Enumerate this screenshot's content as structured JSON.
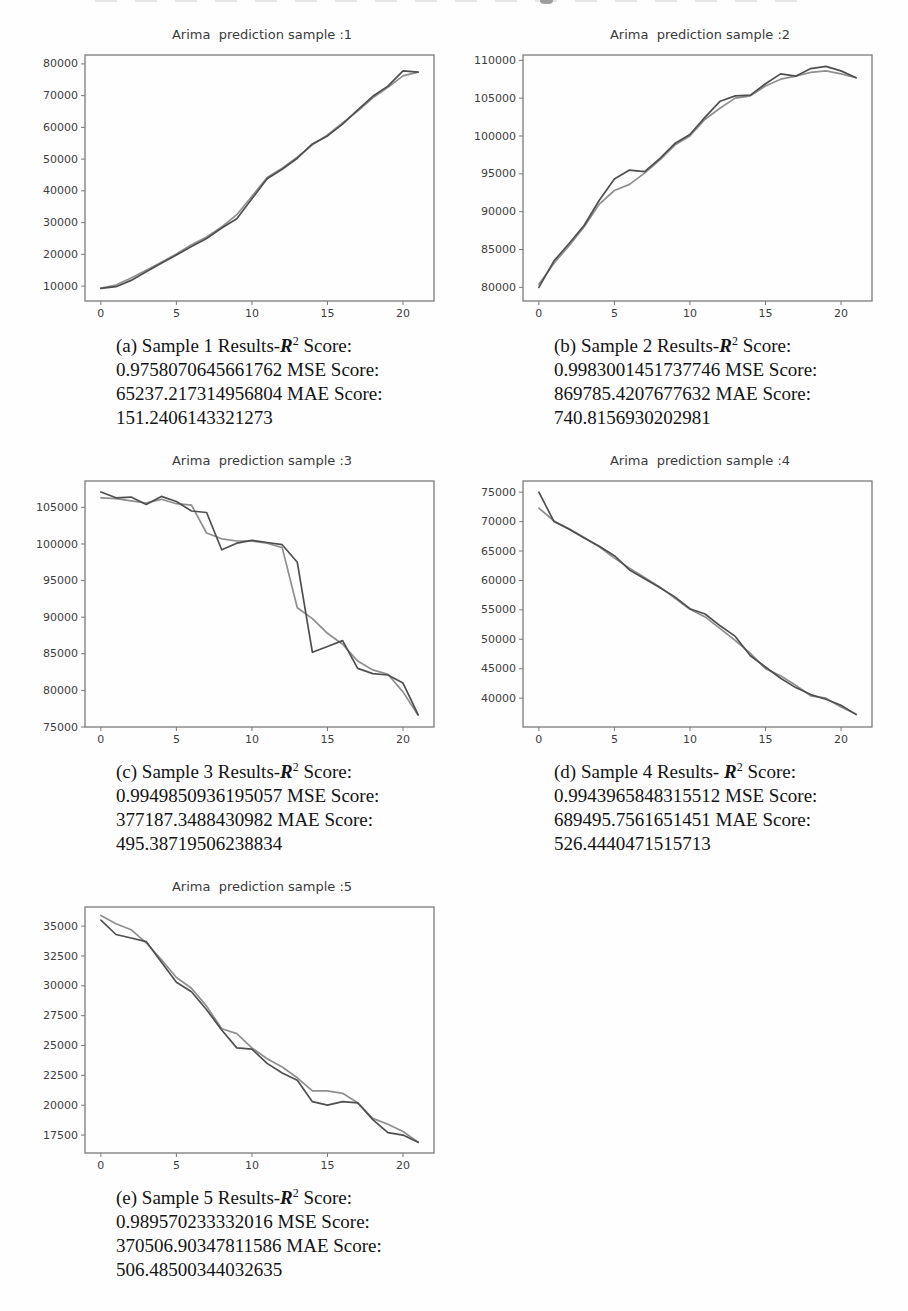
{
  "figures": [
    {
      "id": "a",
      "title": "Arima  prediction sample :1",
      "caption": {
        "prefix": "(a) Sample 1 Results-",
        "r": "R",
        "sup": "2",
        "after": " Score:",
        "rest": "0.9758070645661762 MSE Score:\n65237.217314956804 MAE Score:\n151.2406143321273"
      }
    },
    {
      "id": "b",
      "title": "Arima  prediction sample :2",
      "caption": {
        "prefix": "(b) Sample 2 Results-",
        "r": "R",
        "sup": "2",
        "after": " Score:",
        "rest": "0.9983001451737746 MSE Score:\n869785.4207677632 MAE Score:\n740.8156930202981"
      }
    },
    {
      "id": "c",
      "title": "Arima  prediction sample :3",
      "caption": {
        "prefix": "(c) Sample 3 Results-",
        "r": "R",
        "sup": "2",
        "after": " Score:",
        "rest": "0.9949850936195057 MSE Score:\n377187.3488430982 MAE Score:\n495.38719506238834"
      }
    },
    {
      "id": "d",
      "title": "Arima  prediction sample :4",
      "caption": {
        "prefix": "(d) Sample 4 Results- ",
        "r": "R",
        "sup": "2",
        "after": " Score:",
        "rest": "0.9943965848315512 MSE Score:\n689495.7561651451 MAE Score:\n526.4440471515713"
      }
    },
    {
      "id": "e",
      "title": "Arima  prediction sample :5",
      "caption": {
        "prefix": "(e) Sample 5 Results-",
        "r": "R",
        "sup": "2",
        "after": " Score:",
        "rest": "0.989570233332016 MSE Score:\n370506.90347811586 MAE Score:\n506.48500344032635"
      }
    }
  ],
  "style": {
    "actual_color": "#4f4f4f",
    "predicted_color": "#8f8f8f",
    "axis_color": "#7a7a7a",
    "tick_label_color": "#3d3d3d"
  },
  "chart_data": [
    {
      "type": "line",
      "title": "Arima  prediction sample :1",
      "xlabel": "",
      "ylabel": "",
      "grid": false,
      "legend": "none",
      "x": [
        0,
        1,
        2,
        3,
        4,
        5,
        6,
        7,
        8,
        9,
        10,
        11,
        12,
        13,
        14,
        15,
        16,
        17,
        18,
        19,
        20,
        21
      ],
      "xticks": [
        0,
        5,
        10,
        15,
        20
      ],
      "yticks": [
        10000,
        20000,
        30000,
        40000,
        50000,
        60000,
        70000,
        80000
      ],
      "xlim": [
        -1.05,
        22.05
      ],
      "ylim": [
        5300,
        82800
      ],
      "series": [
        {
          "name": "actual",
          "values": [
            9300,
            9800,
            11800,
            14500,
            17200,
            19800,
            22500,
            25000,
            28300,
            31200,
            37500,
            43800,
            46800,
            50300,
            54800,
            57300,
            61000,
            65500,
            69800,
            73000,
            77800,
            77400
          ]
        },
        {
          "name": "predicted",
          "values": [
            9400,
            10300,
            12500,
            15000,
            17500,
            20100,
            23000,
            25500,
            28600,
            32500,
            38300,
            44200,
            47100,
            50600,
            54500,
            57600,
            61400,
            65100,
            69300,
            72600,
            76200,
            77400
          ]
        }
      ]
    },
    {
      "type": "line",
      "title": "Arima  prediction sample :2",
      "xlabel": "",
      "ylabel": "",
      "grid": false,
      "legend": "none",
      "x": [
        0,
        1,
        2,
        3,
        4,
        5,
        6,
        7,
        8,
        9,
        10,
        11,
        12,
        13,
        14,
        15,
        16,
        17,
        18,
        19,
        20,
        21
      ],
      "xticks": [
        0,
        5,
        10,
        15,
        20
      ],
      "yticks": [
        80000,
        85000,
        90000,
        95000,
        100000,
        105000,
        110000
      ],
      "xlim": [
        -1.05,
        22.05
      ],
      "ylim": [
        78200,
        110700
      ],
      "series": [
        {
          "name": "actual",
          "values": [
            80000,
            83500,
            85800,
            88200,
            91500,
            94300,
            95500,
            95300,
            97000,
            99000,
            100200,
            102500,
            104600,
            105300,
            105400,
            106900,
            108200,
            107900,
            108900,
            109200,
            108600,
            107700
          ]
        },
        {
          "name": "predicted",
          "values": [
            80400,
            83200,
            85500,
            88000,
            91000,
            92800,
            93600,
            95100,
            96800,
            98800,
            100000,
            102200,
            103700,
            105000,
            105300,
            106600,
            107500,
            107900,
            108400,
            108600,
            108200,
            107700
          ]
        }
      ]
    },
    {
      "type": "line",
      "title": "Arima  prediction sample :3",
      "xlabel": "",
      "ylabel": "",
      "grid": false,
      "legend": "none",
      "x": [
        0,
        1,
        2,
        3,
        4,
        5,
        6,
        7,
        8,
        9,
        10,
        11,
        12,
        13,
        14,
        15,
        16,
        17,
        18,
        19,
        20,
        21
      ],
      "xticks": [
        0,
        5,
        10,
        15,
        20
      ],
      "yticks": [
        75000,
        80000,
        85000,
        90000,
        95000,
        100000,
        105000
      ],
      "xlim": [
        -1.05,
        22.05
      ],
      "ylim": [
        75000,
        108600
      ],
      "series": [
        {
          "name": "actual",
          "values": [
            107100,
            106300,
            106400,
            105400,
            106500,
            105800,
            104500,
            104300,
            99200,
            100100,
            100500,
            100200,
            99900,
            97500,
            85200,
            86000,
            86800,
            83000,
            82300,
            82100,
            81000,
            76700
          ]
        },
        {
          "name": "predicted",
          "values": [
            106300,
            106200,
            105900,
            105600,
            106100,
            105500,
            105300,
            101500,
            100700,
            100400,
            100400,
            100100,
            99500,
            91300,
            89800,
            87800,
            86300,
            84000,
            82800,
            82200,
            79800,
            76600
          ]
        }
      ]
    },
    {
      "type": "line",
      "title": "Arima  prediction sample :4",
      "xlabel": "",
      "ylabel": "",
      "grid": false,
      "legend": "none",
      "x": [
        0,
        1,
        2,
        3,
        4,
        5,
        6,
        7,
        8,
        9,
        10,
        11,
        12,
        13,
        14,
        15,
        16,
        17,
        18,
        19,
        20,
        21
      ],
      "xticks": [
        0,
        5,
        10,
        15,
        20
      ],
      "yticks": [
        40000,
        45000,
        50000,
        55000,
        60000,
        65000,
        70000,
        75000
      ],
      "xlim": [
        -1.05,
        22.05
      ],
      "ylim": [
        35100,
        76900
      ],
      "series": [
        {
          "name": "actual",
          "values": [
            75000,
            70000,
            68700,
            67200,
            65800,
            64200,
            61800,
            60300,
            58800,
            57200,
            55200,
            54300,
            52300,
            50500,
            47200,
            45300,
            43400,
            41800,
            40600,
            39800,
            38800,
            37200
          ]
        },
        {
          "name": "predicted",
          "values": [
            72300,
            70100,
            68800,
            67300,
            65700,
            63800,
            62100,
            60500,
            58900,
            57000,
            55100,
            53800,
            51800,
            49800,
            47600,
            45000,
            43800,
            42200,
            40400,
            40000,
            38500,
            37300
          ]
        }
      ]
    },
    {
      "type": "line",
      "title": "Arima  prediction sample :5",
      "xlabel": "",
      "ylabel": "",
      "grid": false,
      "legend": "none",
      "x": [
        0,
        1,
        2,
        3,
        4,
        5,
        6,
        7,
        8,
        9,
        10,
        11,
        12,
        13,
        14,
        15,
        16,
        17,
        18,
        19,
        20,
        21
      ],
      "xticks": [
        0,
        5,
        10,
        15,
        20
      ],
      "yticks": [
        17500,
        20000,
        22500,
        25000,
        27500,
        30000,
        32500,
        35000
      ],
      "xlim": [
        -1.05,
        22.05
      ],
      "ylim": [
        16000,
        36600
      ],
      "series": [
        {
          "name": "actual",
          "values": [
            35500,
            34300,
            34000,
            33700,
            32000,
            30300,
            29500,
            28000,
            26300,
            24800,
            24700,
            23500,
            22700,
            22100,
            20300,
            20000,
            20300,
            20200,
            18800,
            17700,
            17500,
            16900
          ]
        },
        {
          "name": "predicted",
          "values": [
            35900,
            35200,
            34700,
            33600,
            32200,
            30700,
            29800,
            28300,
            26400,
            26000,
            24800,
            23900,
            23200,
            22300,
            21200,
            21200,
            21000,
            20200,
            18900,
            18400,
            17800,
            16900
          ]
        }
      ]
    }
  ]
}
